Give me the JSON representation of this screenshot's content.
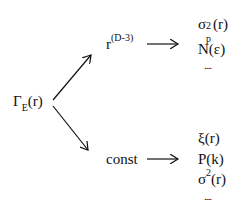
{
  "diagram": {
    "source": {
      "base": "Γ",
      "sub": "E",
      "arg": "(r)"
    },
    "branches": [
      {
        "label_base": "r",
        "label_sup": "(D-3)",
        "outputs": [
          {
            "base": "σ",
            "sup": "2",
            "sub": "p",
            "arg": "(r)"
          },
          {
            "text": "N(ε)"
          },
          {
            "text": "...."
          }
        ]
      },
      {
        "label": "const",
        "outputs": [
          {
            "text": "ξ(r)"
          },
          {
            "text": "P(k)"
          },
          {
            "base": "σ",
            "sup": "2",
            "arg": "(r)"
          },
          {
            "text": "...."
          }
        ]
      }
    ]
  }
}
